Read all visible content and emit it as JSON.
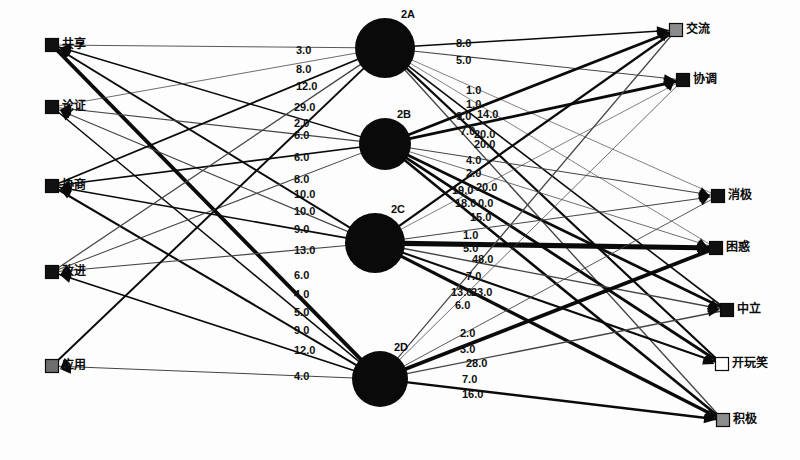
{
  "diagram": {
    "type": "bipartite-transition-network",
    "title": "",
    "background": "#fdfdfd",
    "width": 800,
    "height": 460
  },
  "left_nodes": [
    {
      "id": "L1",
      "label": "共享",
      "x": 52,
      "y": 45,
      "marker_color": "#111111",
      "marker_shape": "square"
    },
    {
      "id": "L2",
      "label": "论证",
      "x": 52,
      "y": 107,
      "marker_color": "#111111",
      "marker_shape": "square"
    },
    {
      "id": "L3",
      "label": "协商",
      "x": 52,
      "y": 186,
      "marker_color": "#111111",
      "marker_shape": "square"
    },
    {
      "id": "L4",
      "label": "改进",
      "x": 52,
      "y": 272,
      "marker_color": "#111111",
      "marker_shape": "square"
    },
    {
      "id": "L5",
      "label": "应用",
      "x": 52,
      "y": 366,
      "marker_color": "#6e6e6e",
      "marker_shape": "square"
    }
  ],
  "middle_nodes": [
    {
      "id": "2A",
      "label": "2A",
      "x": 385,
      "y": 48,
      "r": 30,
      "color": "#0a0a0a"
    },
    {
      "id": "2B",
      "label": "2B",
      "x": 385,
      "y": 144,
      "r": 26,
      "color": "#0a0a0a"
    },
    {
      "id": "2C",
      "label": "2C",
      "x": 375,
      "y": 243,
      "r": 30,
      "color": "#0a0a0a"
    },
    {
      "id": "2D",
      "label": "2D",
      "x": 380,
      "y": 379,
      "r": 28,
      "color": "#0a0a0a"
    }
  ],
  "right_nodes": [
    {
      "id": "R1",
      "label": "交流",
      "x": 676,
      "y": 30,
      "marker_color": "#8c8c8c",
      "marker_shape": "square"
    },
    {
      "id": "R2",
      "label": "协调",
      "x": 683,
      "y": 80,
      "marker_color": "#111111",
      "marker_shape": "square"
    },
    {
      "id": "R3",
      "label": "消极",
      "x": 718,
      "y": 196,
      "marker_color": "#111111",
      "marker_shape": "square"
    },
    {
      "id": "R4",
      "label": "困惑",
      "x": 716,
      "y": 248,
      "marker_color": "#111111",
      "marker_shape": "square"
    },
    {
      "id": "R5",
      "label": "中立",
      "x": 727,
      "y": 310,
      "marker_color": "#111111",
      "marker_shape": "square"
    },
    {
      "id": "R6",
      "label": "开玩笑",
      "x": 722,
      "y": 364,
      "marker_color": "#ffffff",
      "marker_shape": "square"
    },
    {
      "id": "R7",
      "label": "积极",
      "x": 723,
      "y": 420,
      "marker_color": "#8c8c8c",
      "marker_shape": "square"
    }
  ],
  "left_edge_labels": [
    {
      "value": "3.0",
      "x": 296,
      "y": 45
    },
    {
      "value": "8.0",
      "x": 296,
      "y": 64
    },
    {
      "value": "12.0",
      "x": 296,
      "y": 81
    },
    {
      "value": "29.0",
      "x": 294,
      "y": 102
    },
    {
      "value": "2.0",
      "x": 294,
      "y": 118
    },
    {
      "value": "6.0",
      "x": 294,
      "y": 130
    },
    {
      "value": "6.0",
      "x": 294,
      "y": 152
    },
    {
      "value": "8.0",
      "x": 294,
      "y": 174
    },
    {
      "value": "10.0",
      "x": 294,
      "y": 189
    },
    {
      "value": "10.0",
      "x": 294,
      "y": 206
    },
    {
      "value": "9.0",
      "x": 294,
      "y": 224
    },
    {
      "value": "13.0",
      "x": 294,
      "y": 245
    },
    {
      "value": "6.0",
      "x": 294,
      "y": 270
    },
    {
      "value": "4.0",
      "x": 294,
      "y": 289
    },
    {
      "value": "5.0",
      "x": 294,
      "y": 307
    },
    {
      "value": "9.0",
      "x": 294,
      "y": 325
    },
    {
      "value": "12.0",
      "x": 294,
      "y": 345
    },
    {
      "value": "4.0",
      "x": 294,
      "y": 371
    }
  ],
  "right_edge_labels": [
    {
      "value": "8.0",
      "x": 456,
      "y": 38
    },
    {
      "value": "5.0",
      "x": 456,
      "y": 55
    },
    {
      "value": "1.0",
      "x": 466,
      "y": 85
    },
    {
      "value": "1.0",
      "x": 466,
      "y": 99
    },
    {
      "value": "9.0",
      "x": 456,
      "y": 111
    },
    {
      "value": "14.0",
      "x": 477,
      "y": 109
    },
    {
      "value": "7.0",
      "x": 460,
      "y": 126
    },
    {
      "value": "20.0",
      "x": 474,
      "y": 129
    },
    {
      "value": "20.0",
      "x": 474,
      "y": 139
    },
    {
      "value": "4.0",
      "x": 466,
      "y": 155
    },
    {
      "value": "2.0",
      "x": 466,
      "y": 168
    },
    {
      "value": "19.0",
      "x": 452,
      "y": 185
    },
    {
      "value": "20.0",
      "x": 476,
      "y": 182
    },
    {
      "value": "18.0",
      "x": 455,
      "y": 198
    },
    {
      "value": "0.0",
      "x": 478,
      "y": 198
    },
    {
      "value": "15.0",
      "x": 470,
      "y": 212
    },
    {
      "value": "1.0",
      "x": 463,
      "y": 230
    },
    {
      "value": "5.0",
      "x": 463,
      "y": 243
    },
    {
      "value": "48.0",
      "x": 472,
      "y": 254
    },
    {
      "value": "7.0",
      "x": 466,
      "y": 271
    },
    {
      "value": "13.0",
      "x": 451,
      "y": 287
    },
    {
      "value": "23.0",
      "x": 471,
      "y": 287
    },
    {
      "value": "6.0",
      "x": 455,
      "y": 300
    },
    {
      "value": "2.0",
      "x": 460,
      "y": 328
    },
    {
      "value": "3.0",
      "x": 460,
      "y": 344
    },
    {
      "value": "28.0",
      "x": 466,
      "y": 358
    },
    {
      "value": "7.0",
      "x": 462,
      "y": 374
    },
    {
      "value": "16.0",
      "x": 462,
      "y": 389
    }
  ],
  "edges": {
    "left_to_mid": [
      {
        "from": "L1",
        "to": "2A",
        "weight": 3.0
      },
      {
        "from": "L1",
        "to": "2B",
        "weight": 8.0
      },
      {
        "from": "L1",
        "to": "2C",
        "weight": 12.0
      },
      {
        "from": "L1",
        "to": "2D",
        "weight": 29.0
      },
      {
        "from": "L2",
        "to": "2A",
        "weight": 2.0
      },
      {
        "from": "L2",
        "to": "2B",
        "weight": 6.0
      },
      {
        "from": "L2",
        "to": "2C",
        "weight": 6.0
      },
      {
        "from": "L2",
        "to": "2D",
        "weight": 8.0
      },
      {
        "from": "L3",
        "to": "2A",
        "weight": 10.0
      },
      {
        "from": "L3",
        "to": "2B",
        "weight": 10.0
      },
      {
        "from": "L3",
        "to": "2C",
        "weight": 9.0
      },
      {
        "from": "L3",
        "to": "2D",
        "weight": 13.0
      },
      {
        "from": "L4",
        "to": "2A",
        "weight": 6.0
      },
      {
        "from": "L4",
        "to": "2B",
        "weight": 4.0
      },
      {
        "from": "L4",
        "to": "2C",
        "weight": 5.0
      },
      {
        "from": "L4",
        "to": "2D",
        "weight": 9.0
      },
      {
        "from": "L5",
        "to": "2A",
        "weight": 12.0
      },
      {
        "from": "L5",
        "to": "2D",
        "weight": 4.0
      }
    ],
    "mid_to_right": [
      {
        "from": "2A",
        "to": "R1",
        "weight": 8.0
      },
      {
        "from": "2A",
        "to": "R2",
        "weight": 5.0
      },
      {
        "from": "2A",
        "to": "R3",
        "weight": 1.0
      },
      {
        "from": "2A",
        "to": "R4",
        "weight": 1.0
      },
      {
        "from": "2A",
        "to": "R5",
        "weight": 9.0
      },
      {
        "from": "2A",
        "to": "R6",
        "weight": 14.0
      },
      {
        "from": "2A",
        "to": "R7",
        "weight": 7.0
      },
      {
        "from": "2B",
        "to": "R1",
        "weight": 20.0
      },
      {
        "from": "2B",
        "to": "R2",
        "weight": 20.0
      },
      {
        "from": "2B",
        "to": "R3",
        "weight": 4.0
      },
      {
        "from": "2B",
        "to": "R4",
        "weight": 2.0
      },
      {
        "from": "2B",
        "to": "R5",
        "weight": 19.0
      },
      {
        "from": "2B",
        "to": "R6",
        "weight": 20.0
      },
      {
        "from": "2B",
        "to": "R7",
        "weight": 18.0
      },
      {
        "from": "2C",
        "to": "R1",
        "weight": 15.0
      },
      {
        "from": "2C",
        "to": "R2",
        "weight": 1.0
      },
      {
        "from": "2C",
        "to": "R3",
        "weight": 5.0
      },
      {
        "from": "2C",
        "to": "R4",
        "weight": 48.0
      },
      {
        "from": "2C",
        "to": "R5",
        "weight": 7.0
      },
      {
        "from": "2C",
        "to": "R6",
        "weight": 13.0
      },
      {
        "from": "2C",
        "to": "R7",
        "weight": 23.0
      },
      {
        "from": "2D",
        "to": "R1",
        "weight": 6.0
      },
      {
        "from": "2D",
        "to": "R2",
        "weight": 2.0
      },
      {
        "from": "2D",
        "to": "R3",
        "weight": 3.0
      },
      {
        "from": "2D",
        "to": "R4",
        "weight": 28.0
      },
      {
        "from": "2D",
        "to": "R5",
        "weight": 7.0
      },
      {
        "from": "2D",
        "to": "R7",
        "weight": 16.0
      }
    ]
  }
}
